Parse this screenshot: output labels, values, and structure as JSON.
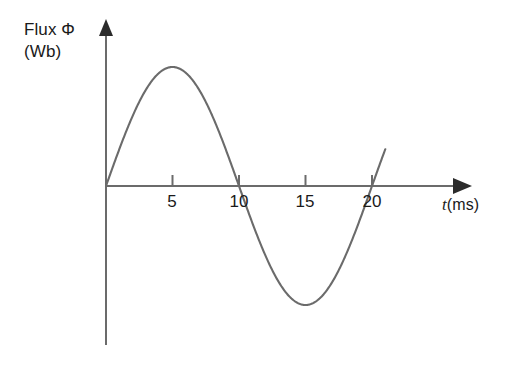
{
  "figure": {
    "background_color": "#ffffff",
    "axis_color": "#6b6b6b",
    "curve_color": "#6b6b6b",
    "text_color": "#1a1a1a"
  },
  "axes": {
    "y_label_line1": "Flux Φ",
    "y_label_line2": "(Wb)",
    "x_label_symbol": "t",
    "x_label_unit": "(ms)",
    "x_tick_labels": [
      "5",
      "10",
      "15",
      "20"
    ],
    "x_tick_values": [
      5,
      10,
      15,
      20
    ]
  },
  "chart_data": {
    "type": "line",
    "title": "",
    "xlabel": "t (ms)",
    "ylabel": "Flux Φ (Wb)",
    "xlim": [
      0,
      21
    ],
    "ylim": [
      -1.2,
      1.2
    ],
    "grid": false,
    "legend": null,
    "waveform": {
      "shape": "sine",
      "period_ms": 20,
      "amplitude_normalized": 1,
      "phase": 0,
      "zero_crossings_ms": [
        0,
        10,
        20
      ],
      "maximum_at_ms": 5,
      "minimum_at_ms": 15,
      "drawn_range_ms": [
        0,
        21
      ]
    },
    "x": [
      0,
      1,
      2,
      3,
      4,
      5,
      6,
      7,
      8,
      9,
      10,
      11,
      12,
      13,
      14,
      15,
      16,
      17,
      18,
      19,
      20,
      21
    ],
    "values": [
      0,
      0.31,
      0.59,
      0.81,
      0.95,
      1,
      0.95,
      0.81,
      0.59,
      0.31,
      0,
      -0.31,
      -0.59,
      -0.81,
      -0.95,
      -1,
      -0.95,
      -0.81,
      -0.59,
      -0.31,
      0,
      0.31
    ]
  }
}
